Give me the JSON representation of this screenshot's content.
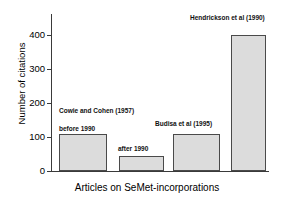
{
  "chart_data": {
    "type": "bar",
    "title": "",
    "xlabel": "Articles on SeMet-incorporations",
    "ylabel": "Number of citations",
    "categories": [
      "before 1990",
      "after 1990",
      "Budisa et al (1995)",
      "Hendrickson et al (1990)"
    ],
    "values": [
      108,
      45,
      110,
      400
    ],
    "ylim": [
      0,
      430
    ],
    "yticks": [
      0,
      100,
      200,
      300,
      400
    ],
    "ytick_labels": [
      "0",
      "100",
      "200",
      "300",
      "400"
    ],
    "grid": false,
    "legend": false,
    "bar_color": "#dcdcdc",
    "bar_edge_color": "#4a4a4a",
    "axis_color": "#3a3a3a",
    "annotations": [
      {
        "text": "Cowie and Cohen (1957)",
        "bar_index": 0
      },
      {
        "text": "before 1990",
        "bar_index": 0
      },
      {
        "text": "after 1990",
        "bar_index": 1
      },
      {
        "text": "Budisa et al (1995)",
        "bar_index": 2
      },
      {
        "text": "Hendrickson et al (1990)",
        "bar_index": 3
      }
    ]
  },
  "axis": {
    "y_title": "Number of citations",
    "x_title": "Articles on SeMet-incorporations",
    "tick0": "0",
    "tick1": "100",
    "tick2": "200",
    "tick3": "300",
    "tick4": "400"
  },
  "labels": {
    "cowie": "Cowie and Cohen (1957)",
    "before1990": "before 1990",
    "after1990": "after 1990",
    "budisa": "Budisa et al (1995)",
    "hendrickson": "Hendrickson et al (1990)"
  }
}
